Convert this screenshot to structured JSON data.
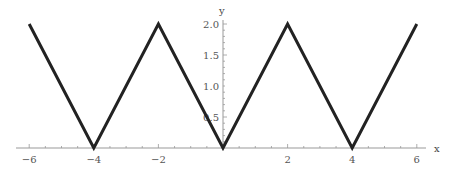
{
  "chart_data": {
    "type": "line",
    "title": "",
    "xlabel": "x",
    "ylabel": "y",
    "xlim": [
      -6,
      6
    ],
    "ylim": [
      0,
      2.0
    ],
    "grid": false,
    "legend": "none",
    "x_ticks": [
      "-6",
      "-4",
      "-2",
      "2",
      "4",
      "6"
    ],
    "y_ticks": [
      "0.5",
      "1.0",
      "1.5",
      "2.0"
    ],
    "series": [
      {
        "name": "triangle wave",
        "x": [
          -6,
          -4,
          -2,
          0,
          2,
          4,
          6
        ],
        "y": [
          2,
          0,
          2,
          0,
          2,
          0,
          2
        ],
        "color": "#222222"
      }
    ]
  },
  "axes": {
    "x_label": "x",
    "y_label": "y",
    "x_tick_labels": [
      "-6",
      "-4",
      "-2",
      "2",
      "4",
      "6"
    ],
    "y_tick_labels": [
      "0.5",
      "1.0",
      "1.5",
      "2.0"
    ]
  }
}
